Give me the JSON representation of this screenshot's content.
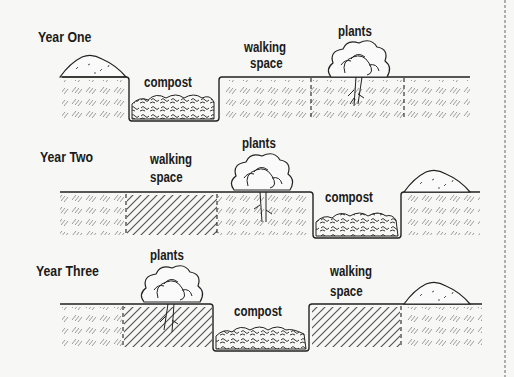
{
  "diagram": {
    "type": "crop rotation trench composting diagram",
    "rows": [
      {
        "year_label": "Year One",
        "sections": [
          {
            "label": "compost"
          },
          {
            "label_line1": "walking",
            "label_line2": "space"
          },
          {
            "label": "plants"
          }
        ]
      },
      {
        "year_label": "Year Two",
        "sections": [
          {
            "label_line1": "walking",
            "label_line2": "space"
          },
          {
            "label": "plants"
          },
          {
            "label": "compost"
          }
        ]
      },
      {
        "year_label": "Year Three",
        "sections": [
          {
            "label": "plants"
          },
          {
            "label": "compost"
          },
          {
            "label_line1": "walking",
            "label_line2": "space"
          }
        ]
      }
    ],
    "colors": {
      "background": "#f7f7f5",
      "ink": "#1a1a1a",
      "hatch": "#8a8a8a"
    }
  }
}
